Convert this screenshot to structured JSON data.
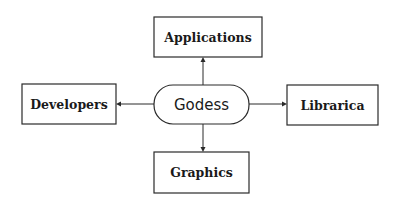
{
  "diagram": {
    "type": "hub-and-spoke",
    "center": {
      "label": "Godess",
      "shape": "rounded-rectangle"
    },
    "nodes": [
      {
        "id": "applications",
        "label": "Applications",
        "position": "top"
      },
      {
        "id": "developers",
        "label": "Developers",
        "position": "left"
      },
      {
        "id": "libraries",
        "label": "Librarica",
        "position": "right"
      },
      {
        "id": "graphics",
        "label": "Graphics",
        "position": "bottom"
      }
    ],
    "edges": [
      {
        "from": "Godess",
        "to": "Applications",
        "direction": "up"
      },
      {
        "from": "Godess",
        "to": "Developers",
        "direction": "left"
      },
      {
        "from": "Godess",
        "to": "Librarica",
        "direction": "right"
      },
      {
        "from": "Godess",
        "to": "Graphics",
        "direction": "down"
      }
    ],
    "colors": {
      "stroke": "#2a2a2a",
      "text": "#1a1a1a",
      "background": "#ffffff"
    }
  }
}
